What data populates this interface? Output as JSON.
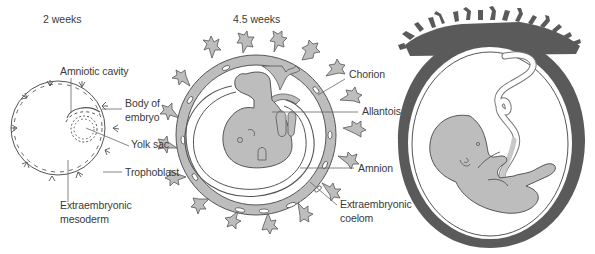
{
  "figure": {
    "panels": [
      {
        "title": "2 weeks",
        "labels": {
          "amniotic_cavity": "Amniotic cavity",
          "body_of_embryo_line1": "Body of",
          "body_of_embryo_line2": "embryo",
          "yolk_sac": "Yolk sac",
          "trophoblast": "Trophoblast",
          "extraembryonic_mesoderm_line1": "Extraembryonic",
          "extraembryonic_mesoderm_line2": "mesoderm"
        }
      },
      {
        "title": "4.5 weeks",
        "labels": {
          "chorion": "Chorion",
          "allantois": "Allantois",
          "amnion": "Amnion",
          "extraembryonic_coelom_line1": "Extraembryonic",
          "extraembryonic_coelom_line2": "coelom"
        }
      },
      {
        "title": "",
        "labels": {}
      }
    ],
    "colors": {
      "text": "#3a3a3a",
      "line": "#555555",
      "tissue_light": "#bdbdbd",
      "tissue_dark": "#5a5a5a",
      "background": "#ffffff"
    }
  }
}
